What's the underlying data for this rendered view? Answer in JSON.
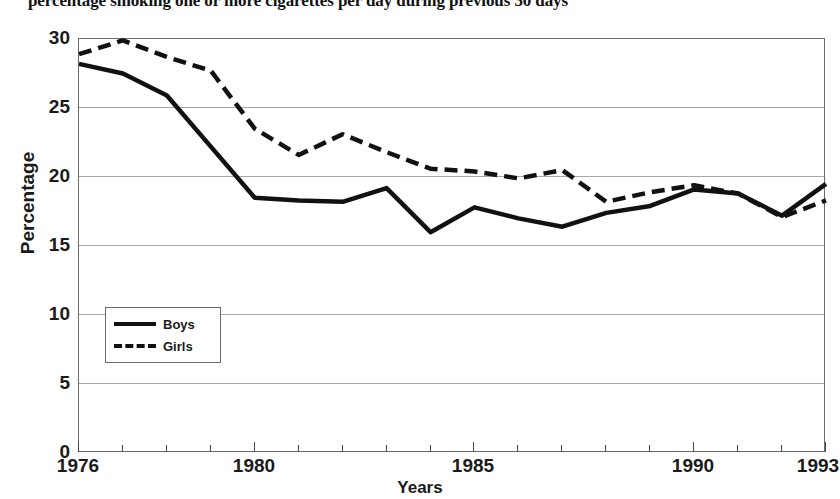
{
  "figure": {
    "title": "percentage smoking one or more cigarettes per day during previous 30 days"
  },
  "axes": {
    "ylabel": "Percentage",
    "xlabel": "Years",
    "yticks": [
      "30",
      "25",
      "20",
      "15",
      "10",
      "5",
      "0"
    ],
    "xticks": [
      "1976",
      "1980",
      "1985",
      "1990",
      "1993"
    ]
  },
  "legend": {
    "items": [
      {
        "label": "Boys",
        "style": "solid",
        "color": "#111111"
      },
      {
        "label": "Girls",
        "style": "dashed",
        "color": "#111111"
      }
    ]
  },
  "chart_data": {
    "type": "line",
    "title": "percentage smoking one or more cigarettes per day during previous 30 days",
    "xlabel": "Years",
    "ylabel": "Percentage",
    "xlim": [
      1976,
      1993
    ],
    "ylim": [
      0,
      30
    ],
    "ytick_values": [
      0,
      5,
      10,
      15,
      20,
      25,
      30
    ],
    "xtick_values": [
      1976,
      1980,
      1985,
      1990,
      1993
    ],
    "grid": "horizontal",
    "legend_position": "lower-left-inside",
    "x": [
      1976,
      1977,
      1978,
      1979,
      1980,
      1981,
      1982,
      1983,
      1984,
      1985,
      1986,
      1987,
      1988,
      1989,
      1990,
      1991,
      1992,
      1993
    ],
    "series": [
      {
        "name": "Boys",
        "style": "solid",
        "color": "#111111",
        "values": [
          28.2,
          27.5,
          25.9,
          22.2,
          18.5,
          18.3,
          18.2,
          19.2,
          16.0,
          17.8,
          17.0,
          16.4,
          17.4,
          17.9,
          19.1,
          18.8,
          17.2,
          19.5
        ]
      },
      {
        "name": "Girls",
        "style": "dashed",
        "color": "#111111",
        "values": [
          28.9,
          29.9,
          28.7,
          27.7,
          23.5,
          21.6,
          23.1,
          21.8,
          20.6,
          20.4,
          19.9,
          20.5,
          18.2,
          18.9,
          19.4,
          18.8,
          17.1,
          18.3
        ]
      }
    ]
  }
}
